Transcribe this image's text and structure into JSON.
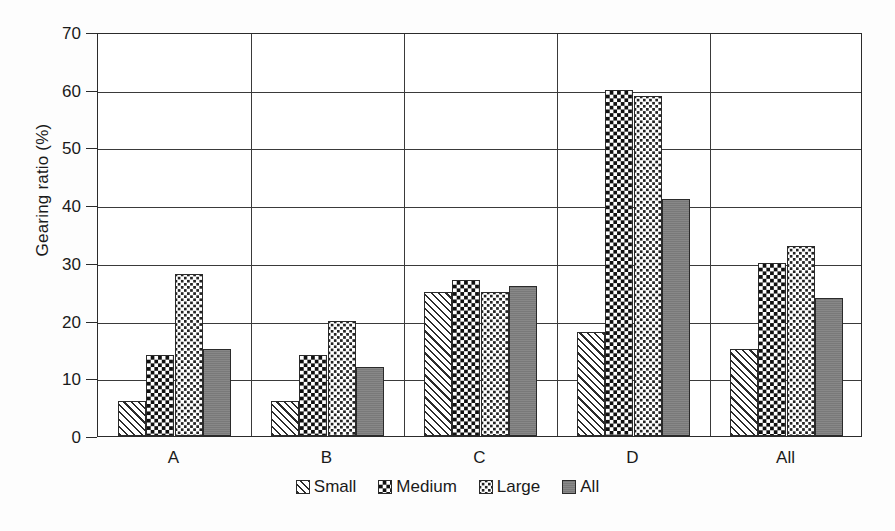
{
  "chart_data": {
    "type": "bar",
    "title": "",
    "subtitle": "",
    "xlabel": "",
    "ylabel": "Gearing ratio (%)",
    "categories": [
      "A",
      "B",
      "C",
      "D",
      "All"
    ],
    "series": [
      {
        "name": "Small",
        "values": [
          6,
          6,
          25,
          18,
          15
        ]
      },
      {
        "name": "Medium",
        "values": [
          14,
          14,
          27,
          60,
          30
        ]
      },
      {
        "name": "Large",
        "values": [
          28,
          20,
          25,
          59,
          33
        ]
      },
      {
        "name": "All",
        "values": [
          15,
          12,
          26,
          41,
          24
        ]
      }
    ],
    "ylim": [
      0,
      70
    ],
    "ytick_values": [
      0,
      10,
      20,
      30,
      40,
      50,
      60,
      70
    ],
    "ytick_labels": [
      "0",
      "10",
      "20",
      "30",
      "40",
      "50",
      "60",
      "70"
    ],
    "grid": true,
    "grid_axis": "both",
    "legend_position": "bottom",
    "series_styles": [
      {
        "name": "Small",
        "pattern": "diagonal-hatch",
        "color": "#ffffff",
        "line_color": "#2b2b2b"
      },
      {
        "name": "Medium",
        "pattern": "dark-checkerboard",
        "color": "#101010",
        "line_color": "#2b2b2b"
      },
      {
        "name": "Large",
        "pattern": "light-dotted-checker",
        "color": "#ffffff",
        "line_color": "#2b2b2b"
      },
      {
        "name": "All",
        "pattern": "solid",
        "color": "#7f7f7f",
        "line_color": "#2b2b2b"
      }
    ],
    "axis_color": "#2b2b2b",
    "background_color": "#ffffff"
  }
}
